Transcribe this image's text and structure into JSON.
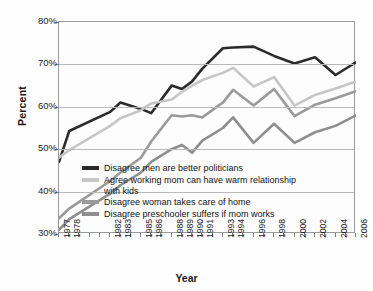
{
  "chart_data": {
    "type": "line",
    "title": "",
    "xlabel": "Year",
    "ylabel": "Percent",
    "ylim": [
      30,
      80
    ],
    "ytick_labels": [
      "30%",
      "40%",
      "50%",
      "60%",
      "70%",
      "80%"
    ],
    "ytick_values": [
      30,
      40,
      50,
      60,
      70,
      80
    ],
    "xlim": [
      1977,
      2006
    ],
    "grid": "horizontal",
    "legend_position": "inside-lower-center",
    "x": [
      1977,
      1978,
      1982,
      1983,
      1985,
      1986,
      1988,
      1989,
      1990,
      1991,
      1993,
      1994,
      1996,
      1998,
      2000,
      2002,
      2004,
      2006
    ],
    "xtick_labels": [
      "1977",
      "1978",
      "1982",
      "1983",
      "1985",
      "1986",
      "1988",
      "1989",
      "1990",
      "1991",
      "1993",
      "1994",
      "1996",
      "1998",
      "2000",
      "2002",
      "2004",
      "2006"
    ],
    "series": [
      {
        "name": "Disagree men are better politicians",
        "color": "#2b2b2b",
        "values": [
          47.0,
          54.3,
          58.8,
          61.0,
          59.5,
          58.5,
          65.0,
          64.2,
          66.0,
          69.0,
          73.8,
          74.0,
          74.2,
          72.0,
          70.2,
          71.7,
          67.5,
          70.5
        ]
      },
      {
        "name": "Agree working mom can have warm relationship with kids",
        "color": "#c6c6c6",
        "values": [
          48.0,
          49.8,
          55.5,
          57.3,
          59.2,
          60.8,
          61.7,
          63.5,
          65.0,
          66.3,
          68.0,
          69.2,
          64.8,
          67.0,
          60.3,
          62.8,
          64.3,
          66.0
        ]
      },
      {
        "name": "Disagree woman takes care of home",
        "color": "#9a9a9a",
        "values": [
          33.7,
          36.0,
          42.5,
          44.5,
          48.0,
          51.8,
          58.0,
          57.7,
          58.0,
          57.5,
          61.0,
          64.0,
          60.3,
          64.2,
          57.8,
          60.5,
          62.0,
          63.7
        ]
      },
      {
        "name": "Disagree preschooler suffers if mom works",
        "color": "#8e8e8e",
        "values": [
          31.0,
          33.5,
          39.5,
          41.5,
          44.5,
          47.0,
          50.0,
          51.0,
          49.2,
          52.0,
          55.0,
          57.5,
          51.5,
          56.0,
          51.5,
          54.0,
          55.5,
          58.0
        ]
      }
    ],
    "legend_entries": [
      {
        "label": "Disagree men are better politicians",
        "color": "#2b2b2b",
        "two_line": false
      },
      {
        "label": "Agree working mom can have warm relationship with kids",
        "color": "#c6c6c6",
        "two_line": true
      },
      {
        "label": "Disagree woman takes care of home",
        "color": "#9a9a9a",
        "two_line": false
      },
      {
        "label": "Disagree preschooler suffers if mom works",
        "color": "#8e8e8e",
        "two_line": false
      }
    ]
  }
}
